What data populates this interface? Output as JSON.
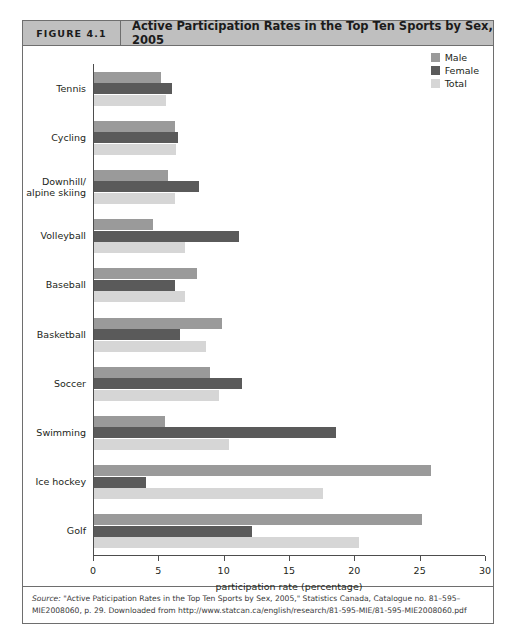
{
  "figure": {
    "number_label": "FIGURE 4.1",
    "title": "Active Participation Rates in the Top Ten Sports by Sex, 2005",
    "source_lead": "Source:",
    "source_text": " \"Active Paticipation Rates in the Top Ten Sports by Sex, 2005,\" Statistics Canada, Catalogue no. 81–595–MIE2008060, p. 29. Downloaded from http://www.statcan.ca/english/research/81-595-MIE/81-595-MIE2008060.pdf"
  },
  "chart_data": {
    "type": "bar",
    "orientation": "horizontal",
    "title": "Active Participation Rates in the Top Ten Sports by Sex, 2005",
    "xlabel": "participation rate (percentage)",
    "ylabel": "",
    "xlim": [
      0,
      30
    ],
    "xticks": [
      0,
      5,
      10,
      15,
      20,
      25,
      30
    ],
    "grid": false,
    "legend_position": "top-right",
    "categories": [
      "Tennis",
      "Cycling",
      "Downhill/\nalpine skiing",
      "Volleyball",
      "Baseball",
      "Basketball",
      "Soccer",
      "Swimming",
      "Ice hockey",
      "Golf"
    ],
    "series": [
      {
        "name": "Male",
        "color": "#9a9a9a",
        "values": [
          5.1,
          6.2,
          5.7,
          4.5,
          7.9,
          9.8,
          8.9,
          5.4,
          25.8,
          25.1
        ]
      },
      {
        "name": "Female",
        "color": "#5a5a5a",
        "values": [
          6.0,
          6.4,
          8.0,
          11.1,
          6.2,
          6.6,
          11.3,
          18.5,
          4.0,
          12.1
        ]
      },
      {
        "name": "Total",
        "color": "#d6d6d6",
        "values": [
          5.5,
          6.3,
          6.2,
          7.0,
          7.0,
          8.6,
          9.6,
          10.3,
          17.5,
          20.3
        ]
      }
    ]
  }
}
